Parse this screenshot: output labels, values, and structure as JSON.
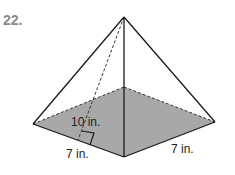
{
  "problem_number": "22.",
  "figure": {
    "type": "square pyramid",
    "slant_height_label": "10 in.",
    "base_side_left_label": "7 in.",
    "base_side_right_label": "7 in.",
    "base_color": "#a8a8a8",
    "line_color": "#1a1a1a"
  }
}
